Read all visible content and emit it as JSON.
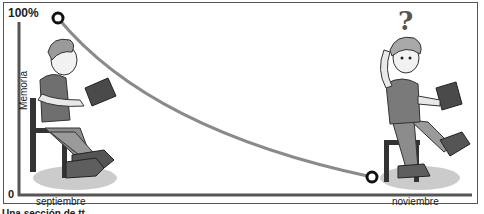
{
  "diagram": {
    "type": "forgetting-curve-illustration",
    "y_axis": {
      "title": "Memoria",
      "top_label": "100%",
      "bottom_label": "0"
    },
    "x_axis": {
      "start_label": "septiembre",
      "end_label": "noviembre"
    },
    "curve": {
      "start": {
        "x_label": "septiembre",
        "memory_pct": 100
      },
      "end": {
        "x_label": "noviembre",
        "memory_pct": 10
      },
      "color": "#8a8a8a"
    },
    "characters": [
      {
        "id": "student-reading",
        "description": "boy sitting on chair reading a book",
        "position": "left"
      },
      {
        "id": "student-confused",
        "description": "boy sitting on chair holding book, scratching head",
        "position": "right",
        "symbol": "?"
      }
    ],
    "caption_partial": "Una sección de tt"
  }
}
